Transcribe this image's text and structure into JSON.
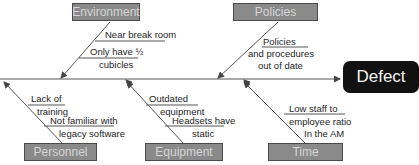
{
  "effect": {
    "label": "Defect"
  },
  "categories": {
    "environment": {
      "label": "Environment",
      "causes": [
        "Near break room",
        "Only have ½",
        "cubicles"
      ]
    },
    "policies": {
      "label": "Policies",
      "causes": [
        "Policies",
        "and procedures",
        "out of date"
      ]
    },
    "personnel": {
      "label": "Personnel",
      "causes": [
        "Lack of",
        "training",
        "Not familiar with",
        "legacy software"
      ]
    },
    "equipment": {
      "label": "Equipment",
      "causes": [
        "Outdated",
        "equipment",
        "Headsets have",
        "static"
      ]
    },
    "time": {
      "label": "Time",
      "causes": [
        "Low staff to",
        "employee ratio",
        "In the AM"
      ]
    }
  },
  "colors": {
    "category_fill": "#8a8a8a",
    "category_text": "#d6d6d6",
    "effect_fill": "#111111",
    "effect_text": "#f2f2f2",
    "line": "#555555"
  }
}
